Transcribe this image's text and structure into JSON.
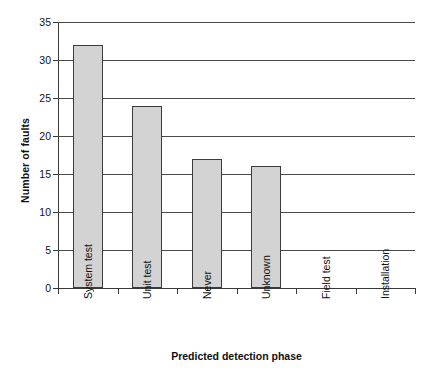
{
  "chart_data": {
    "type": "bar",
    "title": "",
    "categories": [
      "System test",
      "Unit test",
      "Never",
      "Unknown",
      "Field test",
      "Installation"
    ],
    "values": [
      32,
      24,
      17,
      16,
      0,
      0
    ],
    "xlabel": "Predicted detection phase",
    "ylabel": "Number of faults",
    "ylim": [
      0,
      35
    ],
    "ytick_labels": [
      "0",
      "5",
      "10",
      "15",
      "20",
      "25",
      "30",
      "35"
    ],
    "ytick_values": [
      0,
      5,
      10,
      15,
      20,
      25,
      30,
      35
    ],
    "ytick_step": 5,
    "grid": "horizontal",
    "legend": "none",
    "bar_fill_color": "#d3d3d3",
    "bar_edge_color": "#3c3c3c",
    "axis_color": "#3a3a3a",
    "gridline_color": "#4a4a4a",
    "background_color": "#ffffff",
    "xtick_label_rotation": 90
  }
}
